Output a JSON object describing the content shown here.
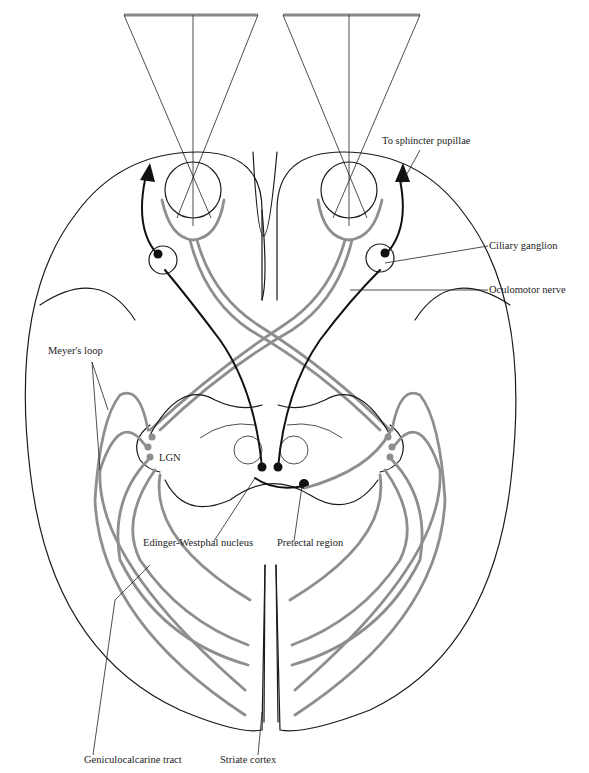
{
  "diagram": {
    "labels": {
      "sphincter": "To sphincter pupillae",
      "ciliary": "Ciliary ganglion",
      "oculomotor": "Oculomotor nerve",
      "meyer": "Meyer's loop",
      "lgn": "LGN",
      "edinger": "Edinger-Westphal nucleus",
      "pretectal": "Pretectal region",
      "geniculo": "Geniculocalcarine tract",
      "striate": "Striate cortex"
    },
    "colors": {
      "visual_pathway": "#8e8e8e",
      "motor_pathway": "#111111",
      "outline": "#1a1a1a",
      "background": "#ffffff"
    }
  }
}
